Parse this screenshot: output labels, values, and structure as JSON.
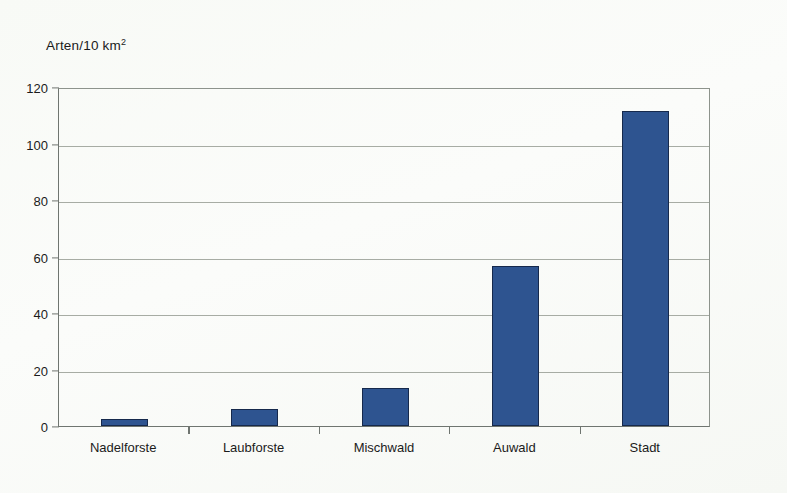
{
  "chart_data": {
    "type": "bar",
    "title": "",
    "subtitle": "",
    "ylabel": "Arten/10 km²",
    "ylabel_base": "Arten/10 km",
    "ylabel_exponent": "2",
    "xlabel": "",
    "categories": [
      "Nadelforste",
      "Laubforste",
      "Mischwald",
      "Auwald",
      "Stadt"
    ],
    "values": [
      2.5,
      6,
      13.5,
      56.5,
      111.5
    ],
    "ylim": [
      0,
      120
    ],
    "ytick_labels": [
      "0",
      "20",
      "40",
      "60",
      "80",
      "100",
      "120"
    ],
    "ytick_values": [
      0,
      20,
      40,
      60,
      80,
      100,
      120
    ],
    "grid": "horizontal",
    "legend": "none",
    "series": [
      {
        "name": "Arten/10 km²",
        "values": [
          2.5,
          6,
          13.5,
          56.5,
          111.5
        ]
      }
    ],
    "colors": {
      "bar_fill": "#2e5490",
      "bar_border": "#16294c",
      "gridline": "#a7aca4",
      "axis": "#6f7570",
      "text": "#1b1b1b",
      "background": "#fbfcfa"
    }
  }
}
